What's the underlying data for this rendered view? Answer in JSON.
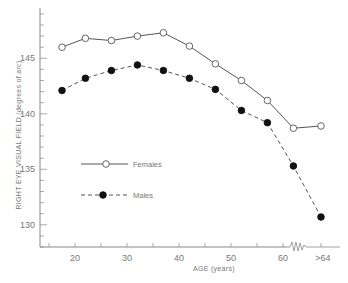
{
  "chart_data": {
    "type": "line",
    "title": "",
    "xlabel": "AGE (years)",
    "ylabel": "RIGHT EYE VISUAL FIELD (degrees of arc)",
    "x_tick_labels": [
      "20",
      "30",
      "40",
      "50",
      "60",
      ">64"
    ],
    "x_ticks": [
      20,
      30,
      40,
      50,
      60,
      66
    ],
    "y_tick_labels": [
      "130",
      "135",
      "140",
      "145"
    ],
    "y_ticks": [
      130,
      135,
      140,
      145
    ],
    "ylim": [
      127.8,
      149.5
    ],
    "xlim": [
      13,
      70
    ],
    "axis_break": "between 60 and >64",
    "grid": false,
    "legend_position": "inside, middle-left",
    "x": [
      17.5,
      22,
      27,
      32,
      37,
      42,
      47,
      52,
      57,
      62,
      66
    ],
    "x_labels": [
      "17.5",
      "22",
      "27",
      "32",
      "37",
      "42",
      "47",
      "52",
      "57",
      "62",
      ">64"
    ],
    "series": [
      {
        "name": "Females",
        "style": "solid line, open circle markers",
        "values": [
          146.0,
          146.8,
          146.6,
          147.0,
          147.3,
          146.1,
          144.5,
          143.0,
          141.2,
          138.7,
          138.9
        ]
      },
      {
        "name": "Males",
        "style": "dashed line, filled circle markers",
        "values": [
          142.1,
          143.2,
          143.9,
          144.4,
          143.9,
          143.2,
          142.2,
          140.3,
          139.2,
          135.3,
          130.7
        ]
      }
    ]
  },
  "colors": {
    "axis": "#888888",
    "line": "#555555",
    "marker_fill_female": "#ffffff",
    "marker_fill_male": "#111111",
    "text": "#777777"
  }
}
